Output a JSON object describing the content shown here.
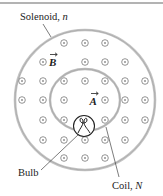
{
  "figure": {
    "labels": {
      "solenoid": "Solenoid, ",
      "solenoid_var": "n",
      "coil": "Coil, ",
      "coil_var": "N",
      "bulb": "Bulb",
      "field_b": "B",
      "area_a": "A"
    },
    "colors": {
      "top_rule": "#9a9a9a",
      "solenoid_ring": "#b8b8b8",
      "coil_ring": "#b0b0b0",
      "dot_symbol": "#555555",
      "leader_line": "#444444",
      "bulb": "#222222"
    },
    "field_symbol": "dot-out-of-page",
    "grid": {
      "columns_x": [
        22,
        43,
        64,
        85,
        105,
        125,
        145
      ],
      "rows_y": [
        43,
        62,
        81,
        100,
        120,
        140,
        158
      ]
    }
  }
}
